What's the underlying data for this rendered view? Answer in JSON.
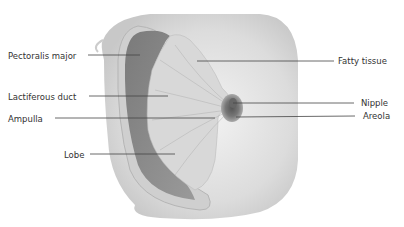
{
  "diagram": {
    "labels": [
      {
        "id": "pectoralis-major",
        "text": "Pectoralis major",
        "x": 8,
        "y": 51,
        "side": "left"
      },
      {
        "id": "lactiferous-duct",
        "text": "Lactiferous duct",
        "x": 8,
        "y": 92,
        "side": "left"
      },
      {
        "id": "ampulla",
        "text": "Ampulla",
        "x": 8,
        "y": 115,
        "side": "left"
      },
      {
        "id": "lobe",
        "text": "Lobe",
        "x": 64,
        "y": 149,
        "side": "left"
      },
      {
        "id": "fatty-tissue",
        "text": "Fatty tissue",
        "x": 338,
        "y": 56,
        "side": "right"
      },
      {
        "id": "nipple",
        "text": "Nipple",
        "x": 361,
        "y": 96,
        "side": "right"
      },
      {
        "id": "areola",
        "text": "Areola",
        "x": 363,
        "y": 112,
        "side": "right"
      }
    ],
    "colors": {
      "text": "#333333",
      "leader": "#444444",
      "skin": "#e4e4e4",
      "muscle": "#8a8a8a",
      "gland": "#d6d6d6",
      "areola": "#777777"
    }
  }
}
